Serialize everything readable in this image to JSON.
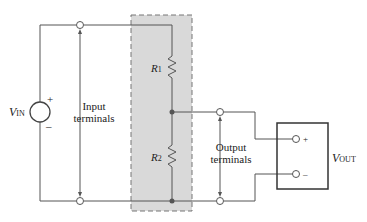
{
  "source": {
    "label": "V",
    "sub": "IN",
    "plus": "+",
    "minus": "–"
  },
  "input_terminals": {
    "line1": "Input",
    "line2": "terminals"
  },
  "output_terminals": {
    "line1": "Output",
    "line2": "terminals"
  },
  "resistors": [
    {
      "label": "R",
      "sub": "1"
    },
    {
      "label": "R",
      "sub": "2"
    }
  ],
  "meter": {
    "label": "V",
    "sub": "OUT",
    "plus": "+",
    "minus": "–"
  },
  "colors": {
    "wire": "#555555",
    "shade": "#d9d9d9",
    "dash": "#777777"
  }
}
